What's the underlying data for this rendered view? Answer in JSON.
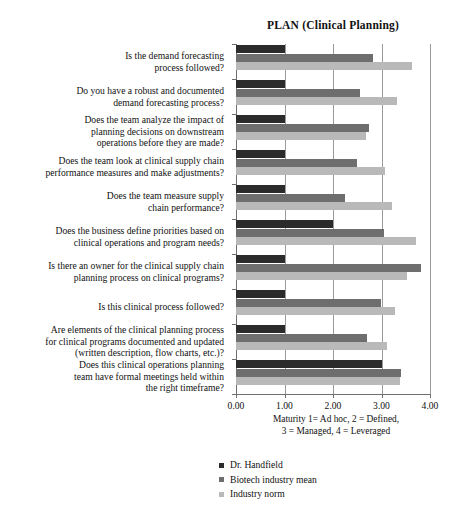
{
  "chart_data": {
    "type": "bar",
    "orientation": "horizontal",
    "title": "PLAN (Clinical Planning)",
    "xlabel": "Maturity 1= Ad hoc, 2 = Defined,\n3 = Managed, 4 = Leveraged",
    "xlabel_line1": "Maturity 1= Ad hoc, 2 = Defined,",
    "xlabel_line2": "3 = Managed, 4 = Leveraged",
    "ylabel": "",
    "xlim": [
      0.0,
      4.0
    ],
    "grid": true,
    "legend_position": "bottom-left",
    "categories": [
      "Is the demand forecasting process followed?",
      "Do you have a robust and documented demand forecasting process?",
      "Does the team analyze the impact of planning decisions on downstream operations before they are made?",
      "Does the team look at clinical supply chain performance measures and make adjustments?",
      "Does the team measure supply chain performance?",
      "Does the business define priorities based on clinical operations and program needs?",
      "Is there an owner for the clinical supply chain planning process on clinical programs?",
      "Is this clinical process followed?",
      "Are elements of the clinical planning process for clinical programs documented and updated (written description, flow charts, etc.)?",
      "Does this clinical operations planning team have formal meetings held within the right timeframe?"
    ],
    "category_lines": [
      [
        "Is the demand forecasting",
        "process followed?"
      ],
      [
        "Do you have a robust and documented",
        "demand forecasting process?"
      ],
      [
        "Does the team analyze the impact of",
        "planning decisions on downstream",
        "operations before they are made?"
      ],
      [
        "Does the team look at clinical supply chain",
        "performance measures and make adjustments?"
      ],
      [
        "Does the team measure supply",
        "chain performance?"
      ],
      [
        "Does the business define priorities based on",
        "clinical operations and program needs?"
      ],
      [
        "Is there an owner for the clinical supply chain",
        "planning process on clinical programs?"
      ],
      [
        "Is this clinical process followed?"
      ],
      [
        "Are elements of the clinical planning process",
        "for clinical programs documented and updated",
        "(written description, flow charts, etc.)?"
      ],
      [
        "Does this clinical operations planning",
        "team have formal meetings held within",
        "the right timeframe?"
      ]
    ],
    "xticks": [
      "0.00",
      "1.00",
      "2.00",
      "3.00",
      "4.00"
    ],
    "xtick_values": [
      0.0,
      1.0,
      2.0,
      3.0,
      4.0
    ],
    "series": [
      {
        "name": "Dr. Handfield",
        "color": "#2b2b2b",
        "values": [
          1.0,
          1.0,
          1.0,
          1.0,
          1.0,
          2.0,
          1.0,
          1.0,
          1.0,
          3.0
        ]
      },
      {
        "name": "Biotech industry mean",
        "color": "#6e6e6e",
        "values": [
          2.82,
          2.56,
          2.74,
          2.5,
          2.25,
          3.05,
          3.81,
          2.98,
          2.7,
          3.4
        ]
      },
      {
        "name": "Industry norm",
        "color": "#b9b9b9",
        "values": [
          3.63,
          3.32,
          2.68,
          3.07,
          3.22,
          3.71,
          3.53,
          3.27,
          3.11,
          3.38
        ]
      }
    ]
  }
}
